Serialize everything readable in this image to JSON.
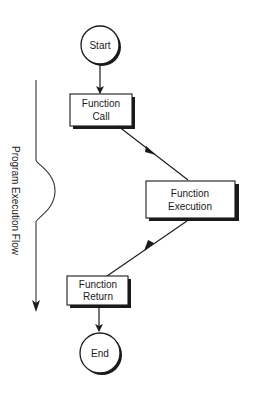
{
  "diagram": {
    "type": "flowchart",
    "side_label": "Program Execution Flow",
    "nodes": {
      "start": {
        "shape": "circle",
        "label": "Start"
      },
      "call": {
        "shape": "box",
        "line1": "Function",
        "line2": "Call"
      },
      "execution": {
        "shape": "box",
        "line1": "Function",
        "line2": "Execution"
      },
      "return": {
        "shape": "box",
        "line1": "Function",
        "line2": "Return"
      },
      "end": {
        "shape": "circle",
        "label": "End"
      }
    },
    "edges": [
      {
        "from": "start",
        "to": "call"
      },
      {
        "from": "call",
        "to": "execution"
      },
      {
        "from": "execution",
        "to": "return"
      },
      {
        "from": "return",
        "to": "end"
      }
    ],
    "colors": {
      "stroke": "#1a1a1a",
      "shadow": "#1a1a1a",
      "fill": "#ffffff"
    }
  }
}
